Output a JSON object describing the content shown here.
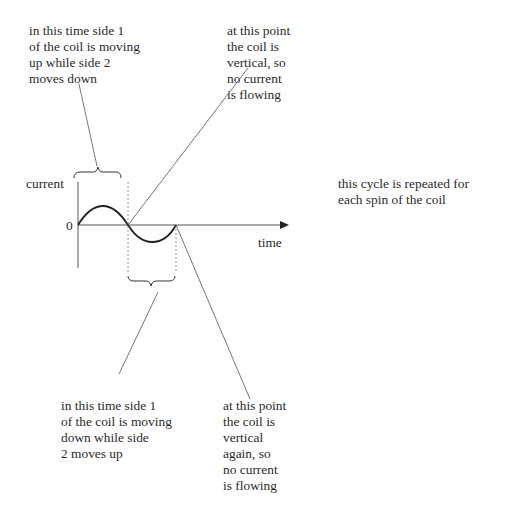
{
  "annotations": {
    "top_left": "in this time side 1\nof the coil is moving\nup while side 2\nmoves down",
    "top_middle": "at this point\nthe coil is\nvertical, so\nno current\nis flowing",
    "right": "this cycle is repeated for\neach spin of the coil",
    "bottom_left": "in this time side 1\nof the coil is moving\ndown while side\n2 moves up",
    "bottom_middle": "at this point\nthe coil is\nvertical\nagain, so\nno current\nis flowing"
  },
  "graph": {
    "y_axis_label": "current",
    "x_axis_label": "time",
    "origin_label": "0"
  },
  "colors": {
    "ink": "#2a2a2a",
    "axis": "#555555",
    "leader": "#666666"
  }
}
